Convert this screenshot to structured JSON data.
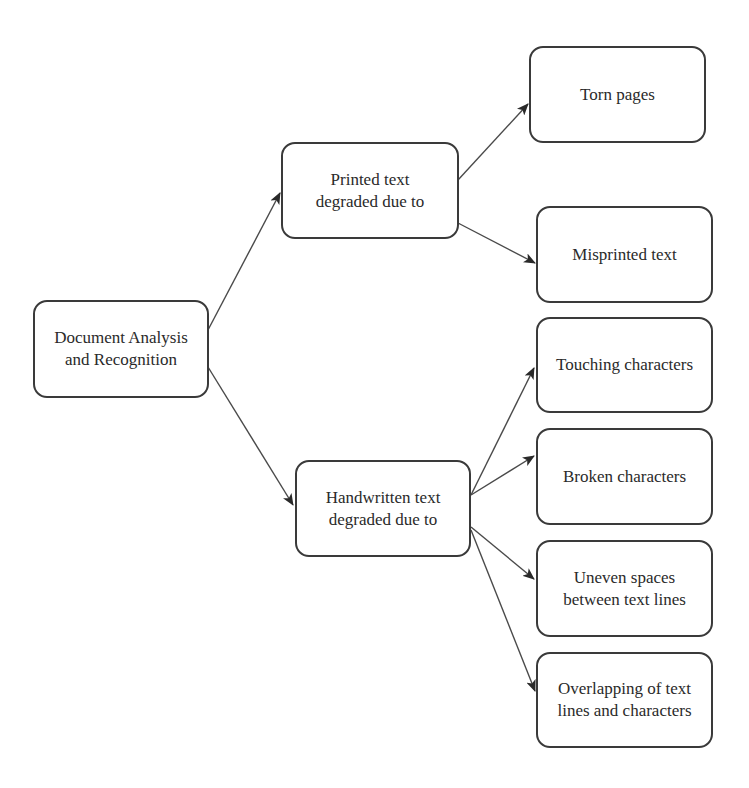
{
  "diagram": {
    "type": "tree",
    "nodes": {
      "root": {
        "label": "Document Analysis\nand Recognition"
      },
      "printed": {
        "label": "Printed text\ndegraded due to"
      },
      "handwritten": {
        "label": "Handwritten text\ndegraded due to"
      },
      "torn": {
        "label": "Torn pages"
      },
      "misprinted": {
        "label": "Misprinted text"
      },
      "touching": {
        "label": "Touching characters"
      },
      "broken": {
        "label": "Broken characters"
      },
      "uneven": {
        "label": "Uneven spaces\nbetween text lines"
      },
      "overlapping": {
        "label": "Overlapping of text\nlines and characters"
      }
    },
    "edges": [
      {
        "from": "root",
        "to": "printed"
      },
      {
        "from": "root",
        "to": "handwritten"
      },
      {
        "from": "printed",
        "to": "torn"
      },
      {
        "from": "printed",
        "to": "misprinted"
      },
      {
        "from": "handwritten",
        "to": "touching"
      },
      {
        "from": "handwritten",
        "to": "broken"
      },
      {
        "from": "handwritten",
        "to": "uneven"
      },
      {
        "from": "handwritten",
        "to": "overlapping"
      }
    ],
    "colors": {
      "stroke": "#3a3a3a",
      "text": "#2a2a2a",
      "background": "#ffffff"
    }
  }
}
